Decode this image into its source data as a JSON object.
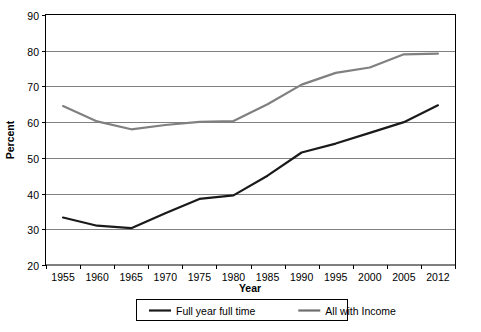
{
  "chart_data": {
    "type": "line",
    "title": "",
    "xlabel": "Year",
    "ylabel": "Percent",
    "grid": true,
    "legend_position": "bottom",
    "xlim": [
      1955,
      2012
    ],
    "ylim": [
      20,
      90
    ],
    "ytick_step": 10,
    "categories": [
      1955,
      1960,
      1965,
      1970,
      1975,
      1980,
      1985,
      1990,
      1995,
      2000,
      2005,
      2012
    ],
    "xtick_labels": [
      "1955",
      "1960",
      "1965",
      "1970",
      "1975",
      "1980",
      "1985",
      "1990",
      "1995",
      "2000",
      "2005",
      "2012"
    ],
    "ytick_labels": [
      "20",
      "30",
      "40",
      "50",
      "60",
      "70",
      "80",
      "90"
    ],
    "ytick_values": [
      20,
      30,
      40,
      50,
      60,
      70,
      80,
      90
    ],
    "series": [
      {
        "name": "Full year full time",
        "color": "#1a1a1a",
        "values": [
          33.3,
          31.0,
          30.3,
          34.5,
          38.5,
          39.5,
          45.0,
          51.5,
          54.0,
          57.0,
          60.0,
          64.7
        ]
      },
      {
        "name": "All with Income",
        "color": "#808080",
        "values": [
          64.5,
          60.2,
          58.0,
          59.2,
          60.1,
          60.3,
          65.0,
          70.5,
          73.8,
          75.3,
          79.0,
          79.2
        ]
      }
    ]
  },
  "legend": {
    "items": [
      {
        "label": "Full year full time",
        "color": "#1a1a1a"
      },
      {
        "label": "All with Income",
        "color": "#6e6e6e"
      }
    ]
  },
  "axes": {
    "x_title": "Year",
    "y_title": "Percent"
  },
  "colors": {
    "plot_border": "#000000",
    "gridline": "#808080",
    "background": "#ffffff",
    "series_dark": "#1a1a1a",
    "series_gray": "#808080"
  }
}
